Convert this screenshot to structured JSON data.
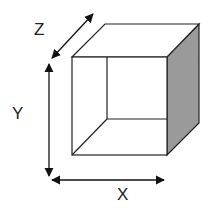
{
  "diagram": {
    "type": "3d-box-axes",
    "labels": {
      "x": "X",
      "y": "Y",
      "z": "Z"
    },
    "colors": {
      "stroke": "#222222",
      "side_face": "#9a9a9a",
      "background": "#ffffff"
    }
  }
}
